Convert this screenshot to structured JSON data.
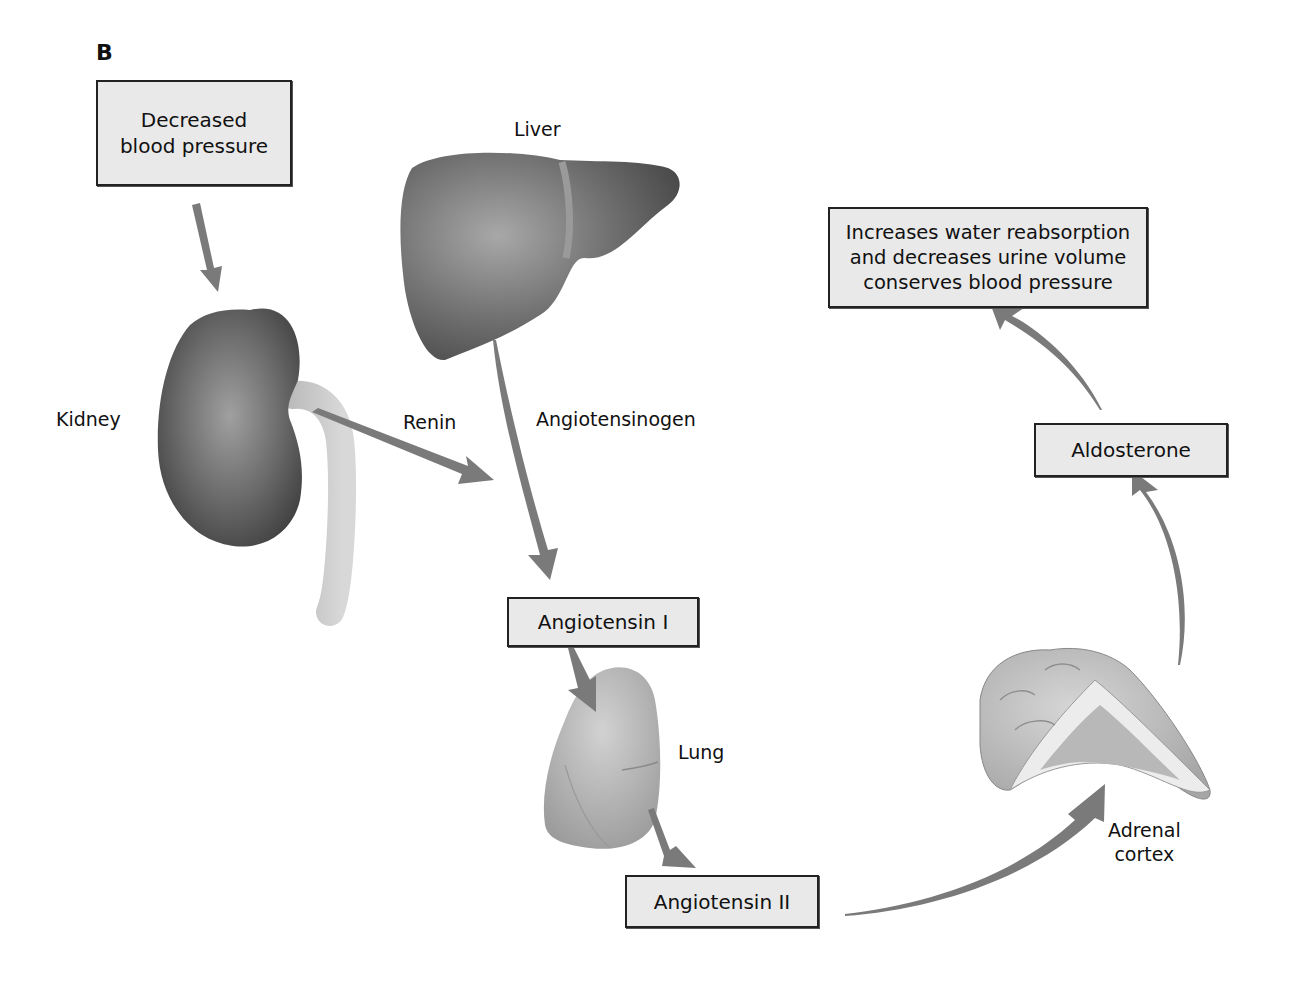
{
  "figure": {
    "panel_label": "B",
    "boxes": {
      "decreased_bp": {
        "lines": [
          "Decreased",
          "blood pressure"
        ]
      },
      "angiotensin_1": {
        "text": "Angiotensin I"
      },
      "angiotensin_2": {
        "text": "Angiotensin II"
      },
      "aldosterone": {
        "text": "Aldosterone"
      },
      "effect": {
        "lines": [
          "Increases water reabsorption",
          "and decreases urine volume",
          "conserves blood pressure"
        ]
      }
    },
    "organs": {
      "liver": "Liver",
      "kidney": "Kidney",
      "lung": "Lung",
      "adrenal": [
        "Adrenal",
        "cortex"
      ]
    },
    "substances": {
      "renin": "Renin",
      "angiotensinogen": "Angiotensinogen"
    },
    "flow": [
      "Decreased blood pressure -> Kidney",
      "Kidney -> Renin",
      "Liver -> Angiotensinogen -> Angiotensin I",
      "Angiotensin I -> Lung -> Angiotensin II",
      "Angiotensin II -> Adrenal cortex",
      "Adrenal cortex -> Aldosterone",
      "Aldosterone -> Increases water reabsorption and decreases urine volume conserves blood pressure"
    ],
    "colors": {
      "box_fill": "#e9e9e9",
      "box_border": "#222222",
      "arrow": "#7a7a7a",
      "organ_dark": "#5a5a5a",
      "organ_light": "#bdbdbd"
    }
  }
}
